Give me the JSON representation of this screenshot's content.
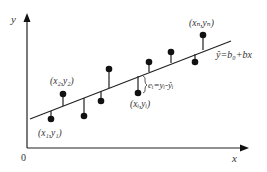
{
  "colors": {
    "line": "#222222",
    "point": "#111111",
    "text": "#333333",
    "background": "#ffffff"
  },
  "axes": {
    "y_label": "y",
    "x_label": "x",
    "origin_label": "0"
  },
  "regression_line": {
    "equation": "ŷ=b₀+bx",
    "start": [
      30,
      119
    ],
    "end": [
      231,
      41
    ]
  },
  "points": [
    {
      "x": 51,
      "y": 119,
      "line_y": 111,
      "label": "(x₁,y₁)"
    },
    {
      "x": 63,
      "y": 94,
      "line_y": 106,
      "label": "(x₂,y₂)"
    },
    {
      "x": 84,
      "y": 116,
      "line_y": 98,
      "label": ""
    },
    {
      "x": 109,
      "y": 69,
      "line_y": 88,
      "label": ""
    },
    {
      "x": 101,
      "y": 93,
      "line_y": 91,
      "label": ""
    },
    {
      "x": 138,
      "y": 93,
      "line_y": 75,
      "label": "(xᵢ,yᵢ)"
    },
    {
      "x": 149,
      "y": 62,
      "line_y": 71,
      "label": ""
    },
    {
      "x": 171,
      "y": 52,
      "line_y": 62,
      "label": ""
    },
    {
      "x": 195,
      "y": 62,
      "line_y": 53,
      "label": ""
    },
    {
      "x": 203,
      "y": 35,
      "line_y": 50,
      "label": "(xₙ,yₙ)"
    }
  ],
  "residual_label": "eᵢ=yᵢ-ŷᵢ",
  "labels": {
    "p1": "(x₁,y₁)",
    "p2": "(x₂,y₂)",
    "pi": "(xᵢ,yᵢ)",
    "pn": "(xₙ,yₙ)"
  }
}
